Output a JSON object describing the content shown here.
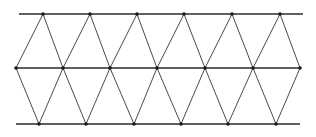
{
  "diagram": {
    "title": "",
    "type": "triangular-lattice-strip",
    "colors": {
      "background": "#ffffff",
      "line": "#2b2b2b",
      "edge": "#4a4a4a",
      "vertex": "#1a1a1a"
    },
    "rows": [
      {
        "name": "top",
        "y": 14,
        "line_x": [
          19,
          303
        ],
        "vertices_x": [
          43,
          90,
          137,
          184,
          232,
          280
        ]
      },
      {
        "name": "middle",
        "y": 68,
        "line_x": [
          16,
          300
        ],
        "vertices_x": [
          16,
          63,
          110,
          157,
          205,
          253,
          300
        ]
      },
      {
        "name": "bottom",
        "y": 124,
        "line_x": [
          16,
          300
        ],
        "vertices_x": [
          39,
          86,
          134,
          181,
          228,
          276
        ]
      }
    ],
    "vertex_radius": 1.8
  }
}
